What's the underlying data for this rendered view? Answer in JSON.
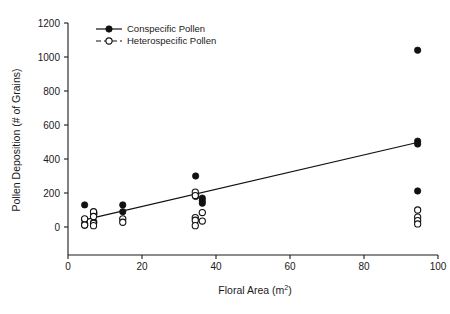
{
  "chart_data": {
    "type": "scatter",
    "title": "",
    "xlabel": "Floral Area (m2)",
    "xlabel_base": "Floral Area (m",
    "xlabel_exponent": "2",
    "xlabel_close": ")",
    "ylabel": "Pollen Deposition (# of Grains)",
    "xlim": [
      0,
      100
    ],
    "ylim": [
      0,
      1200
    ],
    "xticks": [
      0,
      20,
      40,
      60,
      80,
      100
    ],
    "xtick_labels": [
      "0",
      "20",
      "40",
      "60",
      "80",
      "100"
    ],
    "yticks": [
      0,
      200,
      400,
      600,
      800,
      1000,
      1200
    ],
    "ytick_labels": [
      "0",
      "200",
      "400",
      "600",
      "800",
      "1000",
      "1200"
    ],
    "grid": false,
    "legend_position": "top-left",
    "series": [
      {
        "name": "Conspecific Pollen",
        "marker": "filled-circle",
        "line_style": "solid",
        "color": "#111111",
        "points": [
          {
            "x": 4.5,
            "y": 130
          },
          {
            "x": 4.5,
            "y": 45
          },
          {
            "x": 4.5,
            "y": 20
          },
          {
            "x": 4.5,
            "y": 10
          },
          {
            "x": 7.0,
            "y": 85
          },
          {
            "x": 7.0,
            "y": 75
          },
          {
            "x": 7.0,
            "y": 30
          },
          {
            "x": 14.8,
            "y": 130
          },
          {
            "x": 14.8,
            "y": 90
          },
          {
            "x": 34.5,
            "y": 300
          },
          {
            "x": 34.5,
            "y": 190
          },
          {
            "x": 34.5,
            "y": 180
          },
          {
            "x": 36.3,
            "y": 170
          },
          {
            "x": 36.3,
            "y": 155
          },
          {
            "x": 36.3,
            "y": 140
          },
          {
            "x": 94.5,
            "y": 1040
          },
          {
            "x": 94.5,
            "y": 505
          },
          {
            "x": 94.5,
            "y": 488
          },
          {
            "x": 94.5,
            "y": 212
          }
        ]
      },
      {
        "name": "Heterospecific Pollen",
        "marker": "open-circle",
        "line_style": "dashed",
        "color": "#111111",
        "points": [
          {
            "x": 4.5,
            "y": 48
          },
          {
            "x": 4.5,
            "y": 12
          },
          {
            "x": 6.9,
            "y": 90
          },
          {
            "x": 6.9,
            "y": 62
          },
          {
            "x": 6.9,
            "y": 22
          },
          {
            "x": 6.9,
            "y": 8
          },
          {
            "x": 14.8,
            "y": 48
          },
          {
            "x": 14.8,
            "y": 28
          },
          {
            "x": 34.4,
            "y": 205
          },
          {
            "x": 34.4,
            "y": 185
          },
          {
            "x": 34.4,
            "y": 55
          },
          {
            "x": 34.4,
            "y": 40
          },
          {
            "x": 34.4,
            "y": 8
          },
          {
            "x": 36.3,
            "y": 85
          },
          {
            "x": 36.3,
            "y": 35
          },
          {
            "x": 94.5,
            "y": 100
          },
          {
            "x": 94.5,
            "y": 58
          },
          {
            "x": 94.5,
            "y": 38
          },
          {
            "x": 94.5,
            "y": 18
          }
        ]
      }
    ],
    "trend_lines": [
      {
        "name": "conspecific-regression",
        "style": "solid",
        "x1": 5.0,
        "y1": 45,
        "x2": 95.0,
        "y2": 500
      }
    ],
    "legend": [
      {
        "label": "Conspecific Pollen",
        "marker": "filled-circle",
        "line_style": "solid"
      },
      {
        "label": "Heterospecific Pollen",
        "marker": "open-circle",
        "line_style": "dashed"
      }
    ]
  }
}
